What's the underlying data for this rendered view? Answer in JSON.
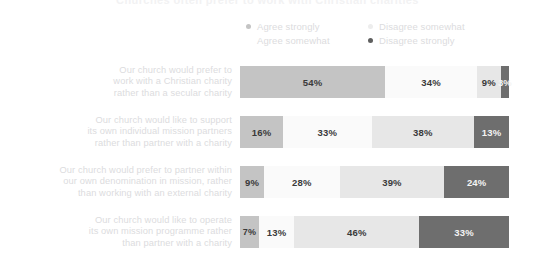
{
  "title": "Churches often prefer to work with Christian charities",
  "legend": [
    {
      "label": "Agree strongly",
      "color": "#c4c4c4",
      "dot": true
    },
    {
      "label": "Disagree somewhat",
      "color": "#ededed",
      "dot": true
    },
    {
      "label": "Agree somewhat",
      "color": "#fafafa",
      "dot": false
    },
    {
      "label": "Disagree strongly",
      "color": "#5f5f5f",
      "dot": true
    }
  ],
  "rows": [
    {
      "label_lines": [
        "Our church would prefer to",
        "work with a Christian charity",
        "rather than a secular charity"
      ],
      "values": [
        "54%",
        "34%",
        "9%",
        "3%"
      ]
    },
    {
      "label_lines": [
        "Our church would like to support",
        "its own individual mission partners",
        "rather than partner with a charity"
      ],
      "values": [
        "16%",
        "33%",
        "38%",
        "13%"
      ]
    },
    {
      "label_lines": [
        "Our church would prefer to partner within",
        "our own denomination in mission, rather",
        "than working with an external charity"
      ],
      "values": [
        "9%",
        "28%",
        "39%",
        "24%"
      ]
    },
    {
      "label_lines": [
        "Our church would like to operate",
        "its own mission programme rather",
        "than partner with a charity"
      ],
      "values": [
        "7%",
        "13%",
        "46%",
        "33%"
      ]
    }
  ],
  "colors": {
    "agree_strongly": "#c4c4c4",
    "agree_somewhat": "#fafafa",
    "disagree_somewhat": "#e7e7e7",
    "disagree_strongly": "#6e6e6e",
    "label_text": "#dcdcde",
    "value_text": "#3a3a3a",
    "value_text_on_dark": "#f4f4f4",
    "background": "#ffffff"
  },
  "chart_data": {
    "type": "bar",
    "orientation": "horizontal",
    "stacked": true,
    "stack_total": 100,
    "units": "percent",
    "title": "Churches often prefer to work with Christian charities",
    "xlabel": "",
    "ylabel": "",
    "xlim": [
      0,
      100
    ],
    "grid": false,
    "legend_position": "top-right",
    "categories": [
      "Our church would prefer to work with a Christian charity rather than a secular charity",
      "Our church would like to support its own individual mission partners rather than partner with a charity",
      "Our church would prefer to partner within our own denomination in mission, rather than working with an external charity",
      "Our church would like to operate its own mission programme rather than partner with a charity"
    ],
    "series": [
      {
        "name": "Agree strongly",
        "color": "#c4c4c4",
        "values": [
          54,
          16,
          9,
          7
        ]
      },
      {
        "name": "Agree somewhat",
        "color": "#fafafa",
        "values": [
          34,
          33,
          28,
          13
        ]
      },
      {
        "name": "Disagree somewhat",
        "color": "#e7e7e7",
        "values": [
          9,
          38,
          39,
          46
        ]
      },
      {
        "name": "Disagree strongly",
        "color": "#6e6e6e",
        "values": [
          3,
          13,
          24,
          33
        ]
      }
    ]
  }
}
